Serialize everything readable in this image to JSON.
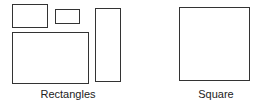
{
  "diagram": {
    "stroke_color": "#333333",
    "groups": [
      {
        "label": "Rectangles",
        "shapes": [
          {
            "type": "rectangle",
            "x": 12,
            "y": 4,
            "w": 36,
            "h": 24
          },
          {
            "type": "rectangle",
            "x": 55,
            "y": 9,
            "w": 25,
            "h": 15
          },
          {
            "type": "rectangle",
            "x": 95,
            "y": 8,
            "w": 26,
            "h": 74
          },
          {
            "type": "rectangle",
            "x": 12,
            "y": 32,
            "w": 77,
            "h": 52
          }
        ]
      },
      {
        "label": "Square",
        "shapes": [
          {
            "type": "square",
            "x": 179,
            "y": 7,
            "w": 71,
            "h": 74
          }
        ]
      }
    ]
  }
}
